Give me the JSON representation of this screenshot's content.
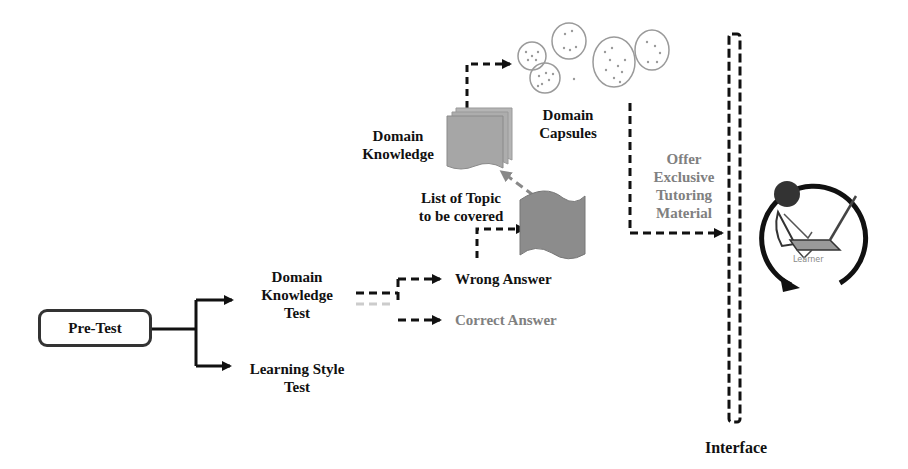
{
  "diagram": {
    "nodes": {
      "pre_test": "Pre-Test",
      "domain_knowledge_test": "Domain\nKnowledge\nTest",
      "learning_style_test": "Learning Style\nTest",
      "wrong_answer": "Wrong Answer",
      "correct_answer": "Correct Answer",
      "list_of_topic": "List of Topic\nto be covered",
      "domain_knowledge": "Domain\nKnowledge",
      "domain_capsules": "Domain\nCapsules",
      "offer_material": "Offer\nExclusive\nTutoring\nMaterial",
      "learner": "Learner",
      "interface": "Interface"
    },
    "edges": [
      {
        "from": "pre_test",
        "to": "domain_knowledge_test",
        "style": "solid"
      },
      {
        "from": "pre_test",
        "to": "learning_style_test",
        "style": "solid"
      },
      {
        "from": "domain_knowledge_test",
        "to": "wrong_answer",
        "style": "dashed"
      },
      {
        "from": "domain_knowledge_test",
        "to": "correct_answer",
        "style": "dashed"
      },
      {
        "from": "wrong_answer",
        "to": "list_of_topic",
        "style": "dashed"
      },
      {
        "from": "list_of_topic",
        "to": "domain_knowledge",
        "style": "dashed-grey"
      },
      {
        "from": "domain_knowledge",
        "to": "domain_capsules",
        "style": "dashed"
      },
      {
        "from": "domain_capsules",
        "to": "interface",
        "style": "dashed",
        "label": "offer_material"
      }
    ],
    "colors": {
      "line": "#111111",
      "grey_text": "#808080",
      "doc_fill": "#a8a8a8",
      "flag_fill": "#8c8c8c",
      "capsule_stroke": "#9a9a9a"
    }
  }
}
